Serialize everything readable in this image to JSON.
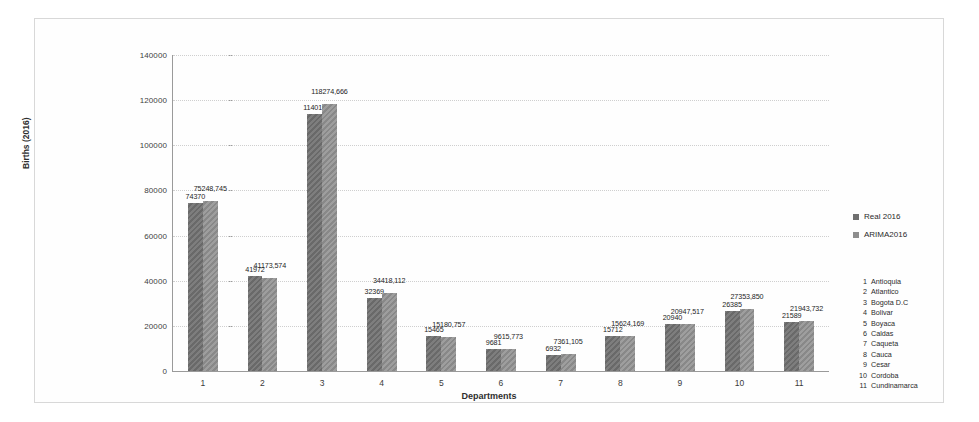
{
  "chart_data": {
    "type": "bar",
    "title": "",
    "xlabel": "Departments",
    "ylabel": "Births (2016)",
    "ylim": [
      0,
      140000
    ],
    "ytick_labels": [
      "140000",
      "120000",
      "100000",
      "80000",
      "60000",
      "40000",
      "20000",
      "0"
    ],
    "yticks": [
      140000,
      120000,
      100000,
      80000,
      60000,
      40000,
      20000,
      0
    ],
    "grid": true,
    "legend_position": "right",
    "categories": [
      "1",
      "2",
      "3",
      "4",
      "5",
      "6",
      "7",
      "8",
      "9",
      "10",
      "11"
    ],
    "series": [
      {
        "name": "Real 2016",
        "color": "#6f6f6f",
        "values": [
          74370,
          41972,
          114013,
          32369,
          15465,
          9681,
          6932,
          15712,
          20940,
          26385,
          21589
        ],
        "labels": [
          "74370",
          "41972",
          "114013",
          "32369",
          "15465",
          "9681",
          "6932",
          "15712",
          "20940",
          "26385",
          "21589"
        ]
      },
      {
        "name": "ARIMA2016",
        "color": "#8e8e8e",
        "values": [
          75248.745,
          41173.574,
          118274.666,
          34418.112,
          15180.757,
          9615.773,
          7361.105,
          15624.169,
          20947.517,
          27353.85,
          21943.732
        ],
        "labels": [
          "75248,745",
          "41173,574",
          "118274,666",
          "34418,112",
          "15180,757",
          "9615,773",
          "7361,105",
          "15624,169",
          "20947,517",
          "27353,850",
          "21943,732"
        ]
      }
    ],
    "department_key": [
      {
        "num": "1",
        "name": "Antioquia"
      },
      {
        "num": "2",
        "name": "Atlantico"
      },
      {
        "num": "3",
        "name": "Bogota D.C"
      },
      {
        "num": "4",
        "name": "Bolivar"
      },
      {
        "num": "5",
        "name": "Boyaca"
      },
      {
        "num": "6",
        "name": "Caldas"
      },
      {
        "num": "7",
        "name": "Caqueta"
      },
      {
        "num": "8",
        "name": "Cauca"
      },
      {
        "num": "9",
        "name": "Cesar"
      },
      {
        "num": "10",
        "name": "Cordoba"
      },
      {
        "num": "11",
        "name": "Cundinamarca"
      }
    ]
  }
}
